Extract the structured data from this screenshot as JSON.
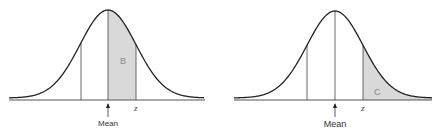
{
  "diagrams": [
    {
      "id": "left",
      "title": "",
      "shaded_region": "between mean and z",
      "area_label": "B",
      "z_label": "z",
      "mean_label": "Mean",
      "shade_color": "#d9d9d9"
    },
    {
      "id": "right",
      "title": "",
      "shaded_region": "beyond z (right tail)",
      "area_label": "C",
      "z_label": "z",
      "mean_label": "Mean",
      "shade_color": "#d9d9d9"
    }
  ],
  "colors": {
    "curve": "#222222",
    "baseline": "#555555",
    "shade": "#d9d9d9",
    "background": "#ffffff"
  }
}
